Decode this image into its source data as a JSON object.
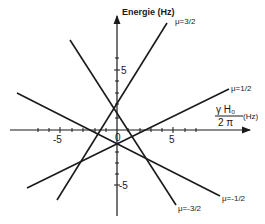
{
  "diagram": {
    "y_axis_label": "Energie (Hz)",
    "x_axis_label_num": "γ H₀",
    "x_axis_label_den": "2 π",
    "x_axis_unit": "(Hz)",
    "tick_labels": {
      "x_neg": "-5",
      "x_zero": "0",
      "x_pos": "5",
      "y_pos": "5",
      "y_neg": "-5"
    },
    "lines": [
      {
        "label": "μ=3/2",
        "slope": 1.5
      },
      {
        "label": "μ=1/2",
        "slope": 0.5
      },
      {
        "label": "μ=-1/2",
        "slope": -0.5
      },
      {
        "label": "μ=-3/2",
        "slope": -1.5
      }
    ],
    "colors": {
      "ink": "#1a1a1a",
      "background": "#ffffff"
    }
  }
}
